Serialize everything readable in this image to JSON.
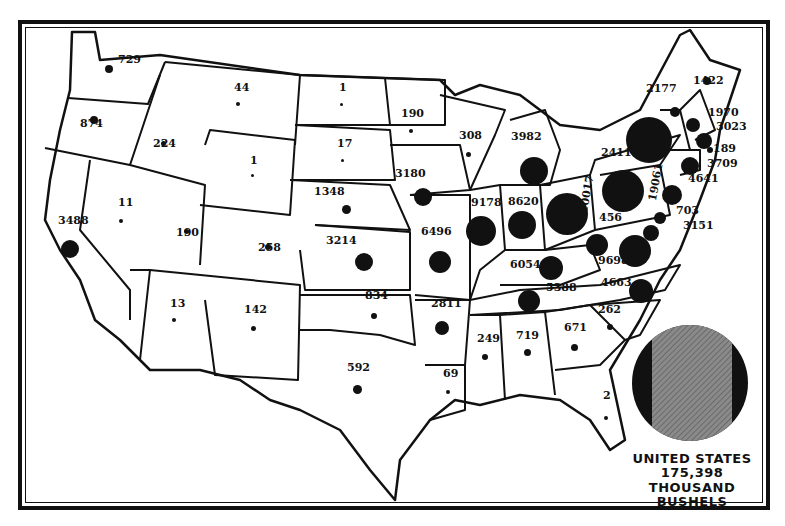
{
  "legend": {
    "line1": "UNITED STATES",
    "line2": "175,398",
    "line3": "THOUSAND BUSHELS",
    "circle_fill": "#111111",
    "hatch_fill": "#7a7a7a"
  },
  "chart_data": {
    "type": "proportional-symbol-map",
    "units": "thousand bushels",
    "total": {
      "label": "UNITED STATES",
      "value": 175398
    },
    "states": [
      {
        "state": "Washington",
        "value": 729
      },
      {
        "state": "Oregon",
        "value": 874
      },
      {
        "state": "California",
        "value": 3488
      },
      {
        "state": "Idaho",
        "value": 224
      },
      {
        "state": "Nevada",
        "value": 11
      },
      {
        "state": "Montana",
        "value": 44
      },
      {
        "state": "Wyoming",
        "value": 1
      },
      {
        "state": "Utah",
        "value": 190
      },
      {
        "state": "Colorado",
        "value": 258
      },
      {
        "state": "Arizona",
        "value": 13
      },
      {
        "state": "New Mexico",
        "value": 142
      },
      {
        "state": "North Dakota",
        "value": 1
      },
      {
        "state": "South Dakota",
        "value": 17
      },
      {
        "state": "Nebraska",
        "value": 1348
      },
      {
        "state": "Kansas",
        "value": 3214
      },
      {
        "state": "Oklahoma",
        "value": 834
      },
      {
        "state": "Texas",
        "value": 592
      },
      {
        "state": "Minnesota",
        "value": 190
      },
      {
        "state": "Iowa",
        "value": 3180
      },
      {
        "state": "Missouri",
        "value": 6496
      },
      {
        "state": "Arkansas",
        "value": 2811
      },
      {
        "state": "Louisiana",
        "value": 69
      },
      {
        "state": "Wisconsin",
        "value": 308
      },
      {
        "state": "Illinois",
        "value": 9178
      },
      {
        "state": "Michigan",
        "value": 3982
      },
      {
        "state": "Indiana",
        "value": 8620
      },
      {
        "state": "Ohio",
        "value": 10017
      },
      {
        "state": "Kentucky",
        "value": 6054
      },
      {
        "state": "Tennessee",
        "value": 5388
      },
      {
        "state": "Mississippi",
        "value": 249
      },
      {
        "state": "Alabama",
        "value": 719
      },
      {
        "state": "Georgia",
        "value": 671
      },
      {
        "state": "Florida",
        "value": 2
      },
      {
        "state": "South Carolina",
        "value": 262
      },
      {
        "state": "North Carolina",
        "value": 4663
      },
      {
        "state": "Virginia",
        "value": 9698
      },
      {
        "state": "West Virginia",
        "value": 456
      },
      {
        "state": "Pennsylvania",
        "value": 19061
      },
      {
        "state": "New York",
        "value": 24111
      },
      {
        "state": "Vermont",
        "value": 2177
      },
      {
        "state": "Maine",
        "value": 1422
      },
      {
        "state": "New Hampshire",
        "value": 1970
      },
      {
        "state": "Massachusetts",
        "value": 3023
      },
      {
        "state": "Rhode Island",
        "value": 189
      },
      {
        "state": "Connecticut",
        "value": 3709
      },
      {
        "state": "New Jersey",
        "value": 4641
      },
      {
        "state": "Delaware",
        "value": 703
      },
      {
        "state": "Maryland",
        "value": 3151
      }
    ]
  },
  "labels": [
    {
      "t": "729",
      "x": 118,
      "y": 64
    },
    {
      "t": "874",
      "x": 80,
      "y": 128
    },
    {
      "t": "3488",
      "x": 58,
      "y": 225
    },
    {
      "t": "224",
      "x": 153,
      "y": 148
    },
    {
      "t": "11",
      "x": 118,
      "y": 207
    },
    {
      "t": "44",
      "x": 234,
      "y": 92
    },
    {
      "t": "1",
      "x": 250,
      "y": 165
    },
    {
      "t": "190",
      "x": 176,
      "y": 237
    },
    {
      "t": "258",
      "x": 258,
      "y": 252
    },
    {
      "t": "13",
      "x": 170,
      "y": 308
    },
    {
      "t": "142",
      "x": 244,
      "y": 314
    },
    {
      "t": "1",
      "x": 339,
      "y": 92
    },
    {
      "t": "17",
      "x": 337,
      "y": 148
    },
    {
      "t": "1348",
      "x": 314,
      "y": 196
    },
    {
      "t": "3214",
      "x": 326,
      "y": 245
    },
    {
      "t": "834",
      "x": 365,
      "y": 300
    },
    {
      "t": "592",
      "x": 347,
      "y": 372
    },
    {
      "t": "190",
      "x": 401,
      "y": 118
    },
    {
      "t": "3180",
      "x": 395,
      "y": 178
    },
    {
      "t": "6496",
      "x": 421,
      "y": 236
    },
    {
      "t": "2811",
      "x": 431,
      "y": 308
    },
    {
      "t": "69",
      "x": 443,
      "y": 378
    },
    {
      "t": "308",
      "x": 459,
      "y": 140
    },
    {
      "t": "9178",
      "x": 471,
      "y": 207
    },
    {
      "t": "3982",
      "x": 511,
      "y": 141
    },
    {
      "t": "8620",
      "x": 508,
      "y": 206
    },
    {
      "t": "6054",
      "x": 510,
      "y": 269
    },
    {
      "t": "5388",
      "x": 546,
      "y": 292
    },
    {
      "t": "249",
      "x": 477,
      "y": 343
    },
    {
      "t": "719",
      "x": 516,
      "y": 340
    },
    {
      "t": "671",
      "x": 564,
      "y": 332
    },
    {
      "t": "2",
      "x": 603,
      "y": 400
    },
    {
      "t": "262",
      "x": 598,
      "y": 314
    },
    {
      "t": "4663",
      "x": 601,
      "y": 287
    },
    {
      "t": "9698",
      "x": 598,
      "y": 265
    },
    {
      "t": "456",
      "x": 599,
      "y": 222
    },
    {
      "t": "24111",
      "x": 601,
      "y": 157
    },
    {
      "t": "2177",
      "x": 646,
      "y": 93
    },
    {
      "t": "1422",
      "x": 693,
      "y": 85
    },
    {
      "t": "1970",
      "x": 708,
      "y": 117
    },
    {
      "t": "3023",
      "x": 716,
      "y": 131
    },
    {
      "t": "189",
      "x": 713,
      "y": 153
    },
    {
      "t": "3709",
      "x": 707,
      "y": 168
    },
    {
      "t": "4641",
      "x": 688,
      "y": 183
    },
    {
      "t": "703",
      "x": 676,
      "y": 215
    },
    {
      "t": "3151",
      "x": 683,
      "y": 230
    }
  ],
  "vlabels": [
    {
      "t": "10017",
      "x": 578,
      "y": 212
    },
    {
      "t": "19061",
      "x": 647,
      "y": 200
    }
  ],
  "dots": [
    {
      "x": 109,
      "y": 69,
      "r": 4
    },
    {
      "x": 94,
      "y": 120,
      "r": 4
    },
    {
      "x": 70,
      "y": 249,
      "r": 9
    },
    {
      "x": 163,
      "y": 143,
      "r": 2.5
    },
    {
      "x": 121,
      "y": 221,
      "r": 2
    },
    {
      "x": 238,
      "y": 104,
      "r": 2
    },
    {
      "x": 252,
      "y": 175,
      "r": 1.5
    },
    {
      "x": 186,
      "y": 231,
      "r": 2.5
    },
    {
      "x": 268,
      "y": 247,
      "r": 3
    },
    {
      "x": 174,
      "y": 320,
      "r": 2
    },
    {
      "x": 253,
      "y": 328,
      "r": 2.5
    },
    {
      "x": 341,
      "y": 104,
      "r": 1.5
    },
    {
      "x": 342,
      "y": 160,
      "r": 1.5
    },
    {
      "x": 346,
      "y": 209,
      "r": 4.5
    },
    {
      "x": 364,
      "y": 262,
      "r": 9
    },
    {
      "x": 374,
      "y": 316,
      "r": 3
    },
    {
      "x": 357,
      "y": 389,
      "r": 4.5
    },
    {
      "x": 411,
      "y": 131,
      "r": 2
    },
    {
      "x": 423,
      "y": 197,
      "r": 9
    },
    {
      "x": 440,
      "y": 262,
      "r": 11
    },
    {
      "x": 442,
      "y": 328,
      "r": 7
    },
    {
      "x": 448,
      "y": 392,
      "r": 2
    },
    {
      "x": 468,
      "y": 154,
      "r": 2.5
    },
    {
      "x": 481,
      "y": 231,
      "r": 15
    },
    {
      "x": 534,
      "y": 171,
      "r": 14
    },
    {
      "x": 522,
      "y": 225,
      "r": 14
    },
    {
      "x": 551,
      "y": 268,
      "r": 12
    },
    {
      "x": 529,
      "y": 301,
      "r": 11
    },
    {
      "x": 485,
      "y": 357,
      "r": 3
    },
    {
      "x": 527,
      "y": 352,
      "r": 3.5
    },
    {
      "x": 574,
      "y": 347,
      "r": 3.5
    },
    {
      "x": 606,
      "y": 418,
      "r": 2
    },
    {
      "x": 610,
      "y": 327,
      "r": 3
    },
    {
      "x": 641,
      "y": 291,
      "r": 12
    },
    {
      "x": 635,
      "y": 251,
      "r": 16
    },
    {
      "x": 597,
      "y": 245,
      "r": 11
    },
    {
      "x": 567,
      "y": 214,
      "r": 21
    },
    {
      "x": 623,
      "y": 191,
      "r": 21
    },
    {
      "x": 649,
      "y": 140,
      "r": 23
    },
    {
      "x": 675,
      "y": 112,
      "r": 5
    },
    {
      "x": 707,
      "y": 81,
      "r": 4
    },
    {
      "x": 693,
      "y": 125,
      "r": 7
    },
    {
      "x": 704,
      "y": 141,
      "r": 8
    },
    {
      "x": 710,
      "y": 150,
      "r": 3
    },
    {
      "x": 690,
      "y": 166,
      "r": 9
    },
    {
      "x": 672,
      "y": 195,
      "r": 10
    },
    {
      "x": 660,
      "y": 218,
      "r": 6
    },
    {
      "x": 651,
      "y": 233,
      "r": 8
    }
  ]
}
